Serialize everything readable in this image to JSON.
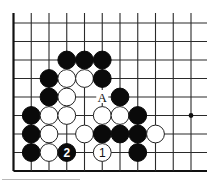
{
  "diagram": {
    "type": "go-board-fragment",
    "grid": {
      "columns": 11,
      "rows": 9,
      "origin_x": 13.5,
      "origin_y": 23,
      "spacing_x": 17.75,
      "spacing_y": 18.5,
      "open_top": true,
      "open_right": true,
      "left_edge": true,
      "bottom_edge": true
    },
    "star_points": [
      {
        "col": 9,
        "row": 5
      }
    ],
    "stones": [
      {
        "color": "black",
        "col": 3,
        "row": 2
      },
      {
        "color": "black",
        "col": 4,
        "row": 2
      },
      {
        "color": "black",
        "col": 5,
        "row": 2
      },
      {
        "color": "black",
        "col": 2,
        "row": 3
      },
      {
        "color": "white",
        "col": 3,
        "row": 3
      },
      {
        "color": "white",
        "col": 4,
        "row": 3
      },
      {
        "color": "black",
        "col": 5,
        "row": 3
      },
      {
        "color": "black",
        "col": 2,
        "row": 4
      },
      {
        "color": "white",
        "col": 3,
        "row": 4
      },
      {
        "color": "black",
        "col": 6,
        "row": 4
      },
      {
        "color": "black",
        "col": 1,
        "row": 5
      },
      {
        "color": "white",
        "col": 2,
        "row": 5
      },
      {
        "color": "white",
        "col": 3,
        "row": 5
      },
      {
        "color": "white",
        "col": 5,
        "row": 5
      },
      {
        "color": "white",
        "col": 6,
        "row": 5
      },
      {
        "color": "black",
        "col": 7,
        "row": 5
      },
      {
        "color": "black",
        "col": 1,
        "row": 6
      },
      {
        "color": "white",
        "col": 2,
        "row": 6
      },
      {
        "color": "white",
        "col": 4,
        "row": 6
      },
      {
        "color": "black",
        "col": 5,
        "row": 6
      },
      {
        "color": "black",
        "col": 6,
        "row": 6
      },
      {
        "color": "black",
        "col": 7,
        "row": 6
      },
      {
        "color": "white",
        "col": 8,
        "row": 6
      },
      {
        "color": "black",
        "col": 1,
        "row": 7
      },
      {
        "color": "white",
        "col": 2,
        "row": 7
      },
      {
        "color": "black",
        "col": 3,
        "row": 7,
        "label": "2"
      },
      {
        "color": "white",
        "col": 5,
        "row": 7,
        "label": "1"
      },
      {
        "color": "black",
        "col": 7,
        "row": 7
      }
    ],
    "marks": [
      {
        "text": "A",
        "col": 5,
        "row": 4
      }
    ],
    "colors": {
      "black_stone": "#0a0a0a",
      "white_stone": "#ffffff",
      "line": "#2a2a2a",
      "background": "#ffffff"
    }
  }
}
